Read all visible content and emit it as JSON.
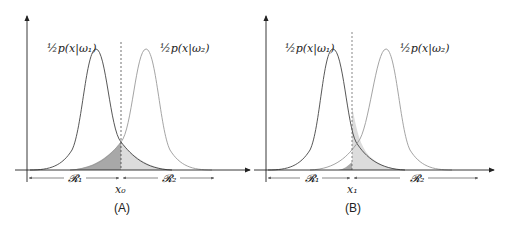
{
  "panels": [
    {
      "id": "A",
      "caption": "(A)",
      "curve_left_label": "½p(x|ω₁)",
      "curve_right_label": "½p(x|ω₂)",
      "region_left": "𝓡₁",
      "region_right": "𝓡₂",
      "threshold_label": "x₀",
      "threshold_note": "optimal decision boundary at intersection of the two curves"
    },
    {
      "id": "B",
      "caption": "(B)",
      "curve_left_label": "½p(x|ω₁)",
      "curve_right_label": "½p(x|ω₂)",
      "region_left": "𝓡₁",
      "region_right": "𝓡₂",
      "threshold_label": "x₁",
      "threshold_note": "decision boundary shifted left of the intersection"
    }
  ],
  "colors": {
    "curve_left": "#444444",
    "curve_right": "#9a9a9a",
    "shade_dark": "#a8a8a8",
    "shade_light": "#dcdcdc",
    "axis": "#222222"
  }
}
